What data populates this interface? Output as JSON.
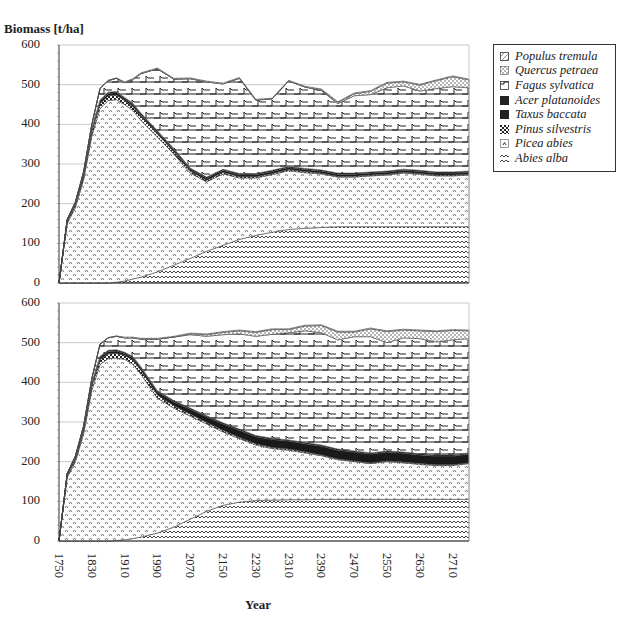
{
  "chart_data": [
    {
      "type": "area",
      "stacked": true,
      "title": "",
      "ylabel": "Biomass [t/ha]",
      "xlabel": "Year",
      "ylim": [
        0,
        600
      ],
      "yticks": [
        0,
        100,
        200,
        300,
        400,
        500,
        600
      ],
      "grid": true,
      "x": [
        1750,
        1770,
        1790,
        1810,
        1830,
        1850,
        1870,
        1890,
        1910,
        1930,
        1950,
        1990,
        2030,
        2070,
        2110,
        2150,
        2190,
        2230,
        2270,
        2310,
        2350,
        2390,
        2430,
        2470,
        2510,
        2550,
        2590,
        2630,
        2670,
        2710,
        2750
      ],
      "series": [
        {
          "name": "Abies alba",
          "values": [
            0,
            0,
            0,
            0,
            0,
            0,
            0,
            2,
            5,
            10,
            15,
            28,
            45,
            62,
            80,
            95,
            110,
            120,
            128,
            135,
            138,
            140,
            142,
            142,
            142,
            142,
            142,
            142,
            142,
            142,
            142
          ]
        },
        {
          "name": "Picea abies",
          "values": [
            0,
            150,
            190,
            260,
            370,
            440,
            460,
            460,
            445,
            425,
            395,
            340,
            280,
            215,
            175,
            180,
            155,
            145,
            145,
            148,
            140,
            135,
            125,
            125,
            128,
            130,
            135,
            132,
            128,
            128,
            130
          ]
        },
        {
          "name": "Pinus silvestris",
          "values": [
            0,
            5,
            6,
            8,
            10,
            12,
            12,
            12,
            10,
            10,
            10,
            8,
            6,
            5,
            4,
            4,
            3,
            3,
            3,
            3,
            3,
            2,
            2,
            2,
            2,
            2,
            2,
            2,
            2,
            2,
            2
          ]
        },
        {
          "name": "Taxus baccata",
          "values": [
            0,
            3,
            4,
            5,
            6,
            6,
            6,
            6,
            5,
            5,
            5,
            5,
            5,
            5,
            5,
            5,
            5,
            5,
            5,
            5,
            5,
            5,
            5,
            5,
            5,
            5,
            5,
            5,
            5,
            5,
            5
          ]
        },
        {
          "name": "Acer platanoides",
          "values": [
            0,
            2,
            2,
            3,
            3,
            3,
            3,
            3,
            3,
            3,
            3,
            3,
            3,
            3,
            3,
            3,
            3,
            3,
            3,
            3,
            3,
            3,
            3,
            3,
            3,
            3,
            3,
            3,
            3,
            3,
            3
          ]
        },
        {
          "name": "Fagus sylvatica",
          "values": [
            0,
            0,
            2,
            4,
            10,
            29,
            29,
            33,
            37,
            60,
            100,
            156,
            175,
            225,
            240,
            215,
            240,
            185,
            180,
            215,
            205,
            200,
            175,
            195,
            195,
            210,
            210,
            200,
            210,
            215,
            210
          ]
        },
        {
          "name": "Quercus petraea",
          "values": [
            0,
            0,
            0,
            0,
            0,
            0,
            0,
            0,
            0,
            0,
            0,
            0,
            0,
            0,
            0,
            0,
            0,
            0,
            0,
            0,
            0,
            2,
            3,
            5,
            8,
            12,
            10,
            15,
            20,
            25,
            20
          ]
        },
        {
          "name": "Populus tremula",
          "values": [
            0,
            0,
            1,
            1,
            1,
            1,
            1,
            1,
            2,
            2,
            2,
            2,
            2,
            2,
            2,
            2,
            2,
            2,
            2,
            2,
            2,
            2,
            2,
            2,
            2,
            2,
            2,
            2,
            2,
            2,
            2
          ]
        }
      ]
    },
    {
      "type": "area",
      "stacked": true,
      "title": "",
      "ylabel": "Biomass [t/ha]",
      "xlabel": "Year",
      "ylim": [
        0,
        600
      ],
      "yticks": [
        0,
        100,
        200,
        300,
        400,
        500,
        600
      ],
      "grid": true,
      "x": [
        1750,
        1770,
        1790,
        1810,
        1830,
        1850,
        1870,
        1890,
        1910,
        1930,
        1950,
        1990,
        2030,
        2070,
        2110,
        2150,
        2190,
        2230,
        2270,
        2310,
        2350,
        2390,
        2430,
        2470,
        2510,
        2550,
        2590,
        2630,
        2670,
        2710,
        2750
      ],
      "series": [
        {
          "name": "Abies alba",
          "values": [
            0,
            0,
            0,
            0,
            0,
            0,
            0,
            1,
            3,
            6,
            10,
            20,
            35,
            55,
            75,
            90,
            98,
            102,
            103,
            104,
            104,
            105,
            105,
            105,
            105,
            105,
            105,
            105,
            105,
            105,
            105
          ]
        },
        {
          "name": "Picea abies",
          "values": [
            0,
            160,
            200,
            270,
            380,
            445,
            460,
            460,
            455,
            440,
            410,
            340,
            300,
            260,
            220,
            185,
            160,
            140,
            130,
            125,
            118,
            110,
            100,
            95,
            90,
            95,
            92,
            88,
            85,
            85,
            90
          ]
        },
        {
          "name": "Pinus silvestris",
          "values": [
            0,
            5,
            6,
            8,
            10,
            12,
            12,
            12,
            10,
            10,
            10,
            8,
            6,
            5,
            4,
            4,
            3,
            3,
            3,
            3,
            3,
            2,
            2,
            2,
            2,
            2,
            2,
            2,
            2,
            2,
            2
          ]
        },
        {
          "name": "Taxus baccata",
          "values": [
            0,
            3,
            4,
            5,
            6,
            6,
            6,
            6,
            5,
            6,
            6,
            8,
            10,
            12,
            14,
            16,
            18,
            18,
            20,
            20,
            20,
            22,
            22,
            22,
            22,
            22,
            22,
            22,
            22,
            22,
            22
          ]
        },
        {
          "name": "Acer platanoides",
          "values": [
            0,
            2,
            2,
            3,
            3,
            3,
            3,
            3,
            3,
            3,
            3,
            3,
            3,
            3,
            3,
            3,
            3,
            3,
            3,
            3,
            3,
            3,
            3,
            3,
            3,
            3,
            3,
            3,
            3,
            3,
            3
          ]
        },
        {
          "name": "Fagus sylvatica",
          "values": [
            0,
            0,
            2,
            4,
            10,
            30,
            31,
            34,
            36,
            47,
            70,
            130,
            160,
            185,
            200,
            222,
            240,
            250,
            262,
            270,
            282,
            283,
            275,
            288,
            293,
            273,
            288,
            290,
            285,
            290,
            288
          ]
        },
        {
          "name": "Quercus petraea",
          "values": [
            0,
            0,
            0,
            0,
            0,
            0,
            0,
            0,
            0,
            0,
            0,
            0,
            0,
            2,
            4,
            6,
            8,
            10,
            12,
            8,
            12,
            18,
            20,
            12,
            20,
            28,
            20,
            20,
            26,
            24,
            20
          ]
        },
        {
          "name": "Populus tremula",
          "values": [
            0,
            0,
            1,
            1,
            1,
            1,
            1,
            1,
            2,
            2,
            2,
            2,
            2,
            2,
            2,
            2,
            2,
            2,
            2,
            2,
            2,
            2,
            2,
            2,
            2,
            2,
            2,
            2,
            2,
            2,
            2
          ]
        }
      ]
    }
  ],
  "axes": {
    "ylabel": "Biomass [t/ha]",
    "xlabel": "Year",
    "yticks": [
      "0",
      "100",
      "200",
      "300",
      "400",
      "500",
      "600"
    ],
    "xticks": [
      "1750",
      "1830",
      "1910",
      "1990",
      "2070",
      "2150",
      "2230",
      "2310",
      "2390",
      "2470",
      "2550",
      "2630",
      "2710"
    ]
  },
  "legend": {
    "items": [
      {
        "label": "Populus tremula",
        "pattern": "diag"
      },
      {
        "label": "Quercus petraea",
        "pattern": "dots"
      },
      {
        "label": "Fagus sylvatica",
        "pattern": "step"
      },
      {
        "label": "Acer platanoides",
        "pattern": "solid"
      },
      {
        "label": "Taxus baccata",
        "pattern": "solid"
      },
      {
        "label": "Pinus silvestris",
        "pattern": "checker"
      },
      {
        "label": "Picea abies",
        "pattern": "caret"
      },
      {
        "label": "Abies alba",
        "pattern": "wave"
      }
    ]
  },
  "colors": {
    "ink": "#222222",
    "grid": "#bbbbbb",
    "pattern": "#555555",
    "background": "#ffffff"
  }
}
